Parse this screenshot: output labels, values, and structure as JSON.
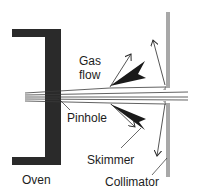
{
  "diagram": {
    "labels": {
      "gas_flow_line1": "Gas",
      "gas_flow_line2": "flow",
      "pinhole": "Pinhole",
      "skimmer": "Skimmer",
      "oven": "Oven",
      "collimator": "Collimator"
    },
    "colors": {
      "oven": "#2a2a2a",
      "skimmer": "#1a1a1a",
      "collimator": "#a8a8a8",
      "beam": "#3a3a3a",
      "text": "#1c1c1c",
      "background": "#ffffff"
    },
    "components": [
      "Oven",
      "Pinhole",
      "Gas flow",
      "Skimmer",
      "Collimator"
    ]
  }
}
